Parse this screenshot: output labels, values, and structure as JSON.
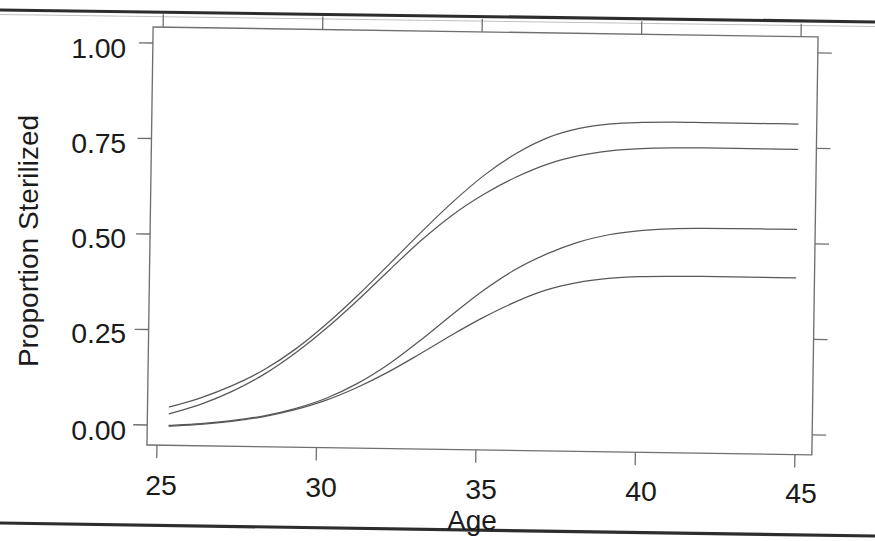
{
  "figure": {
    "name": "proportion-sterilized-by-age-figure",
    "background": "#ffffff",
    "line_color": "#585858",
    "axis_color": "#6f6f6f",
    "text_color": "#1b1b1b",
    "scan_edge_color": "#1d1d1d"
  },
  "chart_data": {
    "type": "line",
    "title": "",
    "subtitle": "",
    "xlabel": "Age",
    "ylabel": "Proportion Sterilized",
    "xlim": [
      24.3,
      45.6
    ],
    "ylim": [
      -0.04,
      1.05
    ],
    "xticks": [
      25,
      30,
      35,
      40,
      45
    ],
    "xtick_labels": [
      "25",
      "30",
      "35",
      "40",
      "45"
    ],
    "yticks": [
      0.0,
      0.25,
      0.5,
      0.75,
      1.0
    ],
    "ytick_labels": [
      "0.00",
      "0.25",
      "0.50",
      "0.75",
      "1.00"
    ],
    "grid": false,
    "legend": false,
    "legend_position": "none",
    "annotations": [],
    "x": [
      25,
      26,
      27,
      28,
      29,
      30,
      31,
      32,
      33,
      34,
      35,
      36,
      37,
      38,
      39,
      40,
      41,
      42,
      43,
      44,
      45
    ],
    "series": [
      {
        "name": "curve-1-upper-plateau-082",
        "values": [
          0.06,
          0.085,
          0.118,
          0.16,
          0.215,
          0.283,
          0.36,
          0.443,
          0.527,
          0.607,
          0.678,
          0.735,
          0.777,
          0.802,
          0.815,
          0.82,
          0.822,
          0.822,
          0.822,
          0.822,
          0.822
        ]
      },
      {
        "name": "curve-2-upper-plateau-076",
        "values": [
          0.042,
          0.068,
          0.103,
          0.148,
          0.205,
          0.272,
          0.347,
          0.427,
          0.505,
          0.573,
          0.628,
          0.673,
          0.708,
          0.731,
          0.745,
          0.752,
          0.755,
          0.756,
          0.756,
          0.756,
          0.756
        ]
      },
      {
        "name": "curve-3-lower-plateau-054",
        "values": [
          0.012,
          0.018,
          0.027,
          0.04,
          0.06,
          0.088,
          0.128,
          0.18,
          0.243,
          0.311,
          0.376,
          0.431,
          0.473,
          0.505,
          0.526,
          0.538,
          0.544,
          0.546,
          0.547,
          0.547,
          0.547
        ]
      },
      {
        "name": "curve-4-lower-plateau-042",
        "values": [
          0.01,
          0.016,
          0.025,
          0.038,
          0.057,
          0.083,
          0.118,
          0.16,
          0.208,
          0.258,
          0.305,
          0.346,
          0.379,
          0.4,
          0.412,
          0.418,
          0.42,
          0.421,
          0.421,
          0.421,
          0.421
        ]
      }
    ]
  }
}
